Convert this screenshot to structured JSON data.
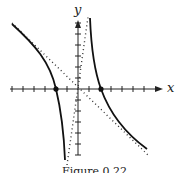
{
  "chart_data": {
    "type": "line",
    "title": "",
    "caption": "Figure 0.22",
    "xlabel": "x",
    "ylabel": "y",
    "xlim": [
      -7,
      7
    ],
    "ylim": [
      -7,
      7
    ],
    "grid": false,
    "ticks_x": [
      -6,
      -5,
      -4,
      -3,
      -2,
      -1,
      1,
      2,
      3,
      4,
      5,
      6
    ],
    "ticks_y": [
      -6,
      -5,
      -4,
      -3,
      -2,
      -1,
      1,
      2,
      3,
      4,
      5,
      6
    ],
    "series": [
      {
        "name": "curve-left-branch",
        "style": "solid",
        "points": [
          [
            -6.2,
            6
          ],
          [
            -4,
            3.2
          ],
          [
            -2,
            0
          ],
          [
            -1.2,
            -3
          ],
          [
            -0.8,
            -7
          ]
        ]
      },
      {
        "name": "curve-right-branch",
        "style": "solid",
        "points": [
          [
            0.8,
            7
          ],
          [
            1.2,
            3
          ],
          [
            2,
            0
          ],
          [
            4,
            -3.2
          ],
          [
            6.2,
            -6
          ]
        ]
      },
      {
        "name": "asymptote-oblique",
        "style": "dotted",
        "points": [
          [
            -6,
            6
          ],
          [
            6,
            -6
          ]
        ]
      },
      {
        "name": "asymptote-vertical-ish",
        "style": "dotted",
        "points": [
          [
            -1,
            -7
          ],
          [
            1,
            7
          ]
        ]
      }
    ],
    "marked_points": [
      [
        -2,
        0
      ],
      [
        2,
        0
      ]
    ]
  }
}
